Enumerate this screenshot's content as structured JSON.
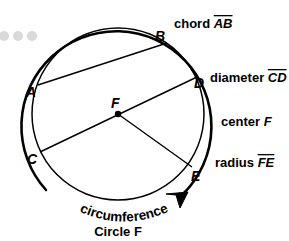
{
  "figure": {
    "background_color": "#ffffff",
    "stroke_color": "#000000",
    "faded_dot_color": "#d9d9d9"
  },
  "points": [
    {
      "name": "A",
      "label": "A",
      "x": 33,
      "y": 92
    },
    {
      "name": "B",
      "label": "B",
      "x": 161,
      "y": 36
    },
    {
      "name": "C",
      "label": "C",
      "x": 34,
      "y": 158
    },
    {
      "name": "D",
      "label": "D",
      "x": 199,
      "y": 83
    },
    {
      "name": "E",
      "label": "E",
      "x": 196,
      "y": 173
    },
    {
      "name": "F",
      "label": "F",
      "x": 118,
      "y": 114
    }
  ],
  "labels": {
    "chord": {
      "text": "chord ",
      "segment": "AB",
      "overline": true
    },
    "diameter": {
      "text": "diameter ",
      "segment": "CD",
      "overline": true
    },
    "center": {
      "text": "center ",
      "segment": "F",
      "overline": false
    },
    "radius": {
      "text": "radius ",
      "segment": "FE",
      "overline": true
    },
    "circumference": "circumference",
    "circle_name": "Circle F"
  },
  "geometry": {
    "inner_circle": {
      "cx": 118,
      "cy": 114,
      "r": 86
    },
    "outer_arc": {
      "cx": 118,
      "cy": 114,
      "r": 95
    },
    "center_dot_radius": 3.2,
    "chord_ab": {
      "x1": 38,
      "y1": 85,
      "x2": 167,
      "y2": 43
    },
    "diameter_cd": {
      "x1": 40,
      "y1": 152,
      "x2": 196,
      "y2": 77
    },
    "radius_fe": {
      "x1": 118,
      "y1": 114,
      "x2": 192,
      "y2": 167
    }
  },
  "decorative_dots": [
    {
      "cx": 4,
      "cy": 36,
      "r": 5
    },
    {
      "cx": 18,
      "cy": 36,
      "r": 5
    },
    {
      "cx": 32,
      "cy": 36,
      "r": 5
    }
  ]
}
